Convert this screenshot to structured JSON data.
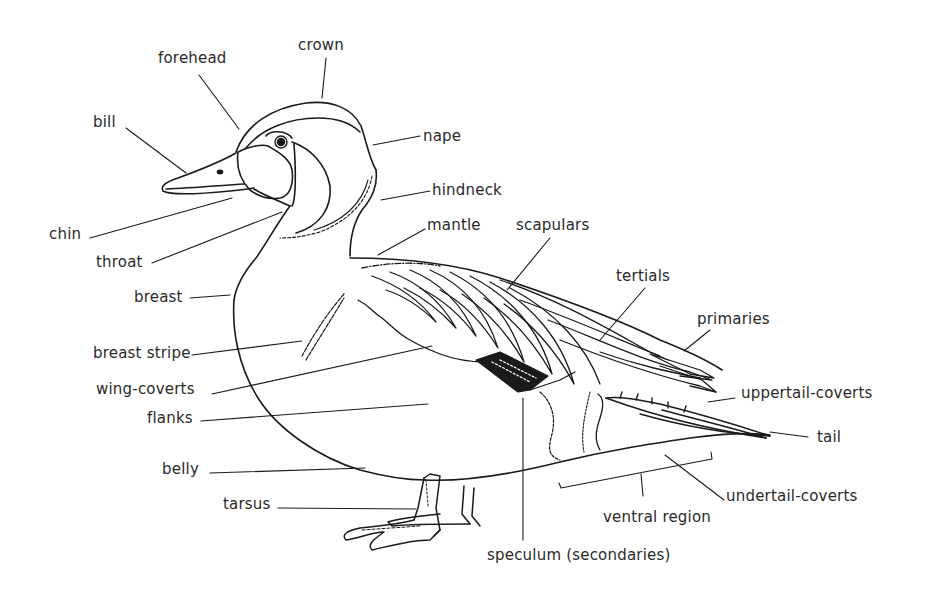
{
  "diagram": {
    "colors": {
      "ink": "#1a1a1a",
      "text": "#2a2a2a",
      "background": "#ffffff"
    },
    "labels": [
      {
        "id": "crown",
        "text": "crown",
        "x": 298,
        "y": 38
      },
      {
        "id": "forehead",
        "text": "forehead",
        "x": 158,
        "y": 51
      },
      {
        "id": "bill",
        "text": "bill",
        "x": 93,
        "y": 115
      },
      {
        "id": "nape",
        "text": "nape",
        "x": 423,
        "y": 129
      },
      {
        "id": "hindneck",
        "text": "hindneck",
        "x": 432,
        "y": 183
      },
      {
        "id": "chin",
        "text": "chin",
        "x": 49,
        "y": 227
      },
      {
        "id": "mantle",
        "text": "mantle",
        "x": 427,
        "y": 218
      },
      {
        "id": "scapulars",
        "text": "scapulars",
        "x": 516,
        "y": 218
      },
      {
        "id": "throat",
        "text": "throat",
        "x": 96,
        "y": 255
      },
      {
        "id": "tertials",
        "text": "tertials",
        "x": 616,
        "y": 269
      },
      {
        "id": "breast",
        "text": "breast",
        "x": 134,
        "y": 290
      },
      {
        "id": "primaries",
        "text": "primaries",
        "x": 697,
        "y": 312
      },
      {
        "id": "breast-stripe",
        "text": "breast stripe",
        "x": 93,
        "y": 346
      },
      {
        "id": "wing-coverts",
        "text": "wing-coverts",
        "x": 96,
        "y": 382
      },
      {
        "id": "uppertail-coverts",
        "text": "uppertail-coverts",
        "x": 741,
        "y": 386
      },
      {
        "id": "flanks",
        "text": "flanks",
        "x": 147,
        "y": 411
      },
      {
        "id": "tail",
        "text": "tail",
        "x": 817,
        "y": 430
      },
      {
        "id": "belly",
        "text": "belly",
        "x": 162,
        "y": 462
      },
      {
        "id": "tarsus",
        "text": "tarsus",
        "x": 223,
        "y": 497
      },
      {
        "id": "undertail-coverts",
        "text": "undertail-coverts",
        "x": 726,
        "y": 489
      },
      {
        "id": "ventral-region",
        "text": "ventral region",
        "x": 603,
        "y": 510
      },
      {
        "id": "speculum",
        "text": "speculum (secondaries)",
        "x": 487,
        "y": 548
      }
    ]
  }
}
